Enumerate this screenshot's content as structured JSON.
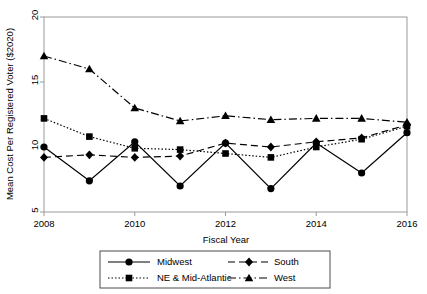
{
  "chart_data": {
    "type": "line",
    "title": "",
    "xlabel": "Fiscal Year",
    "ylabel": "Mean Cost Per Registered Voter ($2020)",
    "x": [
      2008,
      2009,
      2010,
      2011,
      2012,
      2013,
      2014,
      2015,
      2016
    ],
    "xticks": [
      "2008",
      "2010",
      "2012",
      "2014",
      "2016"
    ],
    "xtick_values": [
      2008,
      2010,
      2012,
      2014,
      2016
    ],
    "yticks": [
      "5",
      "10",
      "15",
      "20"
    ],
    "ytick_values": [
      5,
      10,
      15,
      20
    ],
    "xlim": [
      2008,
      2016
    ],
    "ylim": [
      5,
      20
    ],
    "grid": false,
    "legend_position": "below-axis",
    "series": [
      {
        "name": "Midwest",
        "marker": "circle",
        "dash": "solid",
        "values": [
          10.0,
          7.4,
          10.4,
          7.0,
          10.3,
          6.8,
          10.3,
          8.0,
          11.1
        ]
      },
      {
        "name": "NE & Mid-Atlantic",
        "marker": "square",
        "dash": "dotted",
        "values": [
          12.2,
          10.8,
          9.9,
          9.8,
          9.5,
          9.2,
          10.0,
          10.6,
          11.6
        ]
      },
      {
        "name": "South",
        "marker": "diamond",
        "dash": "dashed",
        "values": [
          9.2,
          9.4,
          9.2,
          9.3,
          10.3,
          10.0,
          10.4,
          10.7,
          11.7
        ]
      },
      {
        "name": "West",
        "marker": "triangle",
        "dash": "dashdot",
        "values": [
          17.0,
          16.0,
          13.0,
          12.0,
          12.4,
          12.1,
          12.2,
          12.2,
          11.9
        ]
      }
    ],
    "colors": {
      "line": "#000000",
      "marker": "#000000",
      "axis": "#808080",
      "background": "#ffffff"
    }
  },
  "legend": {
    "entries": [
      {
        "label": "Midwest",
        "marker": "circle",
        "dash": "solid"
      },
      {
        "label": "South",
        "marker": "diamond",
        "dash": "dashed"
      },
      {
        "label": "NE & Mid-Atlantic",
        "marker": "square",
        "dash": "dotted"
      },
      {
        "label": "West",
        "marker": "triangle",
        "dash": "dashdot"
      }
    ]
  }
}
